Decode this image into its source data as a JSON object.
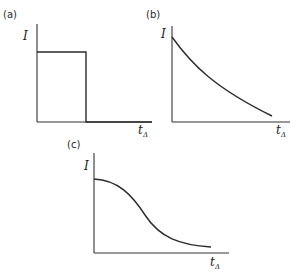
{
  "panels": [
    {
      "id": "a",
      "label": "(a)",
      "ylabel": "I",
      "xlabel_main": "t",
      "xlabel_sub": "Δ",
      "shape": "rectangular pulse: constant I then abrupt drop to zero"
    },
    {
      "id": "b",
      "label": "(b)",
      "ylabel": "I",
      "xlabel_main": "t",
      "xlabel_sub": "Δ",
      "shape": "monotonic exponential-like decay"
    },
    {
      "id": "c",
      "label": "(c)",
      "ylabel": "I",
      "xlabel_main": "t",
      "xlabel_sub": "Δ",
      "shape": "sigmoidal (Gaussian-like) decay"
    }
  ],
  "colors": {
    "line": "#2b2b2b",
    "background": "#ffffff"
  }
}
